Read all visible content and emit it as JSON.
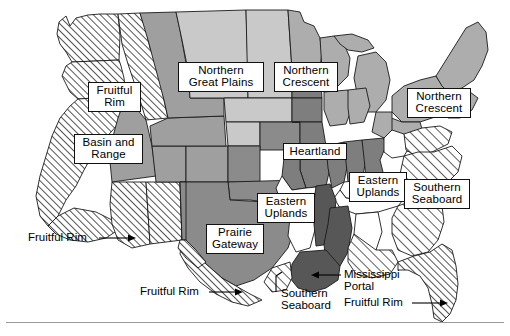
{
  "figure": {
    "type": "choropleth-region-map",
    "background_color": "#ffffff",
    "has_bottom_rule": true
  },
  "legend_shading": {
    "fruitful_rim": {
      "name": "Fruitful Rim",
      "fill": "hatch-45",
      "base": "#ffffff"
    },
    "basin_and_range": {
      "name": "Basin and Range",
      "fill": "solid",
      "base": "#9f9f9f"
    },
    "northern_great_plains": {
      "name": "Northern Great Plains",
      "fill": "solid",
      "base": "#c9c9c9"
    },
    "northern_crescent": {
      "name": "Northern Crescent",
      "fill": "solid",
      "base": "#adadad"
    },
    "heartland": {
      "name": "Heartland",
      "fill": "solid",
      "base": "#7e7e7e"
    },
    "prairie_gateway": {
      "name": "Prairie Gateway",
      "fill": "solid",
      "base": "#8b8b8b"
    },
    "eastern_uplands": {
      "name": "Eastern Uplands",
      "fill": "solid",
      "base": "#ffffff"
    },
    "southern_seaboard": {
      "name": "Southern Seaboard",
      "fill": "hatch-45",
      "base": "#ffffff"
    },
    "mississippi_portal": {
      "name": "Mississippi Portal",
      "fill": "solid",
      "base": "#575757"
    }
  },
  "boxed_labels": [
    {
      "id": "fruitful-rim-nw",
      "text": "Fruitful\nRim",
      "x": 88,
      "y": 82,
      "w": 53
    },
    {
      "id": "northern-great-plains",
      "text": "Northern\nGreat Plains",
      "x": 178,
      "y": 62,
      "w": 86
    },
    {
      "id": "northern-crescent-west",
      "text": "Northern\nCrescent",
      "x": 274,
      "y": 62,
      "w": 64
    },
    {
      "id": "northern-crescent-east",
      "text": "Northern\nCrescent",
      "x": 407,
      "y": 88,
      "w": 64
    },
    {
      "id": "basin-and-range",
      "text": "Basin and\nRange",
      "x": 74,
      "y": 134,
      "w": 69
    },
    {
      "id": "heartland",
      "text": "Heartland",
      "x": 283,
      "y": 143,
      "w": 64
    },
    {
      "id": "eastern-uplands-east",
      "text": "Eastern\nUplands",
      "x": 349,
      "y": 172,
      "w": 58
    },
    {
      "id": "southern-seaboard-east",
      "text": "Southern\nSeaboard",
      "x": 404,
      "y": 179,
      "w": 66
    },
    {
      "id": "eastern-uplands-west",
      "text": "Eastern\nUplands",
      "x": 257,
      "y": 193,
      "w": 58
    },
    {
      "id": "prairie-gateway",
      "text": "Prairie\nGateway",
      "x": 206,
      "y": 224,
      "w": 58
    }
  ],
  "callout_labels": [
    {
      "id": "fruitful-rim-pacific",
      "text": "Fruitful Rim",
      "x": 28,
      "y": 231,
      "align": "left",
      "leader": {
        "x1": 99,
        "y1": 238,
        "x2": 131,
        "y2": 238,
        "arrow": "right"
      }
    },
    {
      "id": "fruitful-rim-southwest",
      "text": "Fruitful Rim",
      "x": 140,
      "y": 285,
      "align": "left",
      "leader": {
        "x1": 209,
        "y1": 292,
        "x2": 238,
        "y2": 292,
        "arrow": "right"
      }
    },
    {
      "id": "southern-seaboard-gulf",
      "text": "Southern\nSeaboard",
      "x": 280,
      "y": 288,
      "align": "left",
      "leader": {
        "x1": 276,
        "y1": 294,
        "x2": 276,
        "y2": 277,
        "arrow": "none"
      }
    },
    {
      "id": "mississippi-portal",
      "text": "Mississippi\nPortal",
      "x": 343,
      "y": 269,
      "align": "left",
      "leader": {
        "x1": 340,
        "y1": 275,
        "x2": 316,
        "y2": 275,
        "arrow": "left"
      }
    },
    {
      "id": "fruitful-rim-florida",
      "text": "Fruitful Rim",
      "x": 343,
      "y": 296,
      "align": "left",
      "leader": {
        "x1": 412,
        "y1": 303,
        "x2": 443,
        "y2": 303,
        "arrow": "right"
      }
    }
  ],
  "region_notes": {
    "states_hatched_fruitful_rim": [
      "Washington",
      "Oregon",
      "California",
      "Idaho-north",
      "Nevada-west",
      "Arizona",
      "New Mexico-south",
      "Texas-south",
      "Florida"
    ],
    "states_mississippi_portal": [
      "Mississippi",
      "Louisiana",
      "Arkansas-east"
    ],
    "states_heartland": [
      "Iowa",
      "Illinois",
      "Indiana",
      "Missouri-north",
      "Ohio-west",
      "Nebraska-east",
      "Minnesota-south"
    ]
  }
}
